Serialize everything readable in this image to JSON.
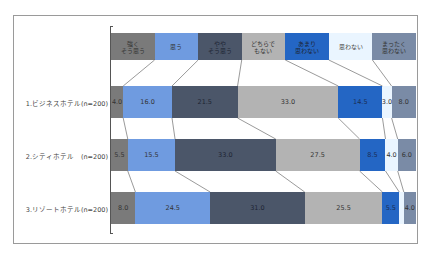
{
  "caption": "",
  "chart_data": {
    "type": "bar",
    "orientation": "horizontal",
    "stacked": true,
    "percent": true,
    "title": "",
    "xlabel": "",
    "ylabel": "",
    "xlim": [
      0,
      100
    ],
    "legend_position": "top",
    "grid": false,
    "series_lines": true,
    "categories": [
      "1.ビジネスホテル(n=200)",
      "2.シティホテル　(n=200)",
      "3.リゾートホテル(n=200)"
    ],
    "series": [
      {
        "name": "強く\nそう思う",
        "color": "#7a7a7a",
        "values": [
          4.0,
          5.5,
          8.0
        ]
      },
      {
        "name": "思う",
        "color": "#6f9be0",
        "values": [
          16.0,
          15.5,
          24.5
        ]
      },
      {
        "name": "やや\nそう思う",
        "color": "#4b5669",
        "values": [
          21.5,
          33.0,
          31.0
        ]
      },
      {
        "name": "どちらで\nもない",
        "color": "#b3b3b3",
        "values": [
          33.0,
          27.5,
          25.5
        ]
      },
      {
        "name": "あまり\n思わない",
        "color": "#2466c4",
        "values": [
          14.5,
          8.5,
          5.5
        ]
      },
      {
        "name": "思わない",
        "color": "#eaf5ff",
        "values": [
          3.0,
          4.0,
          1.5
        ]
      },
      {
        "name": "まったく\n思わない",
        "color": "#7a8ba6",
        "values": [
          8.0,
          6.0,
          4.0
        ]
      }
    ],
    "data_labels": [
      [
        "4.0",
        "16.0",
        "21.5",
        "33.0",
        "14.5",
        "3.0",
        "8.0"
      ],
      [
        "5.5",
        "15.5",
        "33.0",
        "27.5",
        "8.5",
        "4.0",
        "6.0"
      ],
      [
        "8.0",
        "24.5",
        "31.0",
        "25.5",
        "5.5",
        "",
        "4.0"
      ]
    ]
  }
}
